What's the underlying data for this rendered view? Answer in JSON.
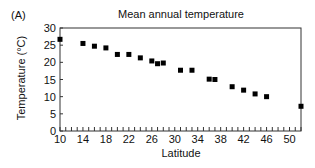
{
  "panel_label": "(A)",
  "chart_data": {
    "type": "scatter",
    "title": "Mean annual temperature",
    "xlabel": "Latitude",
    "ylabel": "Temperature (°C)",
    "xlim": [
      10,
      52
    ],
    "ylim": [
      0,
      30
    ],
    "xticks": [
      10,
      14,
      18,
      22,
      26,
      30,
      34,
      38,
      42,
      46,
      50
    ],
    "yticks": [
      0,
      5,
      10,
      15,
      20,
      25,
      30
    ],
    "grid": false,
    "legend": null,
    "marker": "square",
    "series": [
      {
        "name": "Mean annual temperature",
        "x": [
          10,
          14,
          16,
          18,
          20,
          22,
          24,
          26,
          27,
          28,
          31,
          33,
          36,
          37,
          40,
          42,
          44,
          46,
          52
        ],
        "y": [
          26.7,
          25.5,
          24.7,
          24.2,
          22.3,
          22.3,
          21.3,
          20.4,
          19.6,
          19.8,
          17.7,
          17.7,
          15.1,
          15.0,
          12.9,
          11.9,
          10.8,
          10.0,
          7.2
        ]
      }
    ]
  }
}
